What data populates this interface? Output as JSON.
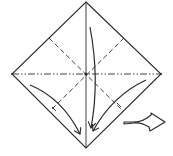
{
  "diagram": {
    "type": "origami-fold-step",
    "colors": {
      "line": "#2a2a2a",
      "background": "#ffffff"
    },
    "square": {
      "top": [
        86,
        2
      ],
      "right": [
        161,
        74
      ],
      "bottom": [
        86,
        148
      ],
      "left": [
        12,
        74
      ]
    },
    "creases": [
      {
        "name": "vertical-center",
        "style": "solid"
      },
      {
        "name": "horizontal-center",
        "style": "mountain-dash-dot"
      },
      {
        "name": "diagonal-upper-left-to-lower-right",
        "style": "valley-dashed"
      },
      {
        "name": "diagonal-upper-right-to-lower-left",
        "style": "valley-dashed"
      }
    ],
    "arrows": [
      {
        "name": "left-fold-arrow",
        "meaning": "fold left flap down to bottom"
      },
      {
        "name": "center-fold-arrow",
        "meaning": "fold top down to bottom"
      },
      {
        "name": "right-fold-arrow",
        "meaning": "fold right flap down to bottom"
      },
      {
        "name": "turn-over-arrow",
        "meaning": "next step / turn"
      }
    ]
  }
}
